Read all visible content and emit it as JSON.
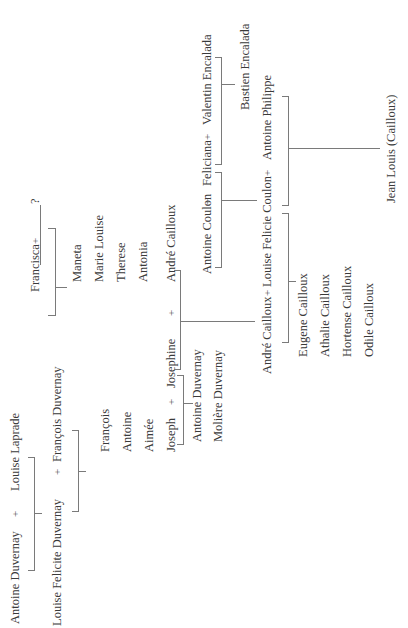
{
  "diagram": {
    "type": "family-tree",
    "orientation": "rotated-90-ccw",
    "line_color": "#7a7a7a",
    "text_color": "#3a3a3a",
    "couples": [
      {
        "id": "c1",
        "partner_a": "Antoine Duvernay",
        "connector": "+",
        "partner_b": "Louise Laprade",
        "children": [
          "Louise Felicite Duvernay"
        ]
      },
      {
        "id": "c2",
        "partner_a": "Louise Felicite Duvernay",
        "connector": "+",
        "partner_b": "François Duvernay",
        "children": [
          "François",
          "Antoine",
          "Aimée",
          "Joseph"
        ]
      },
      {
        "id": "c3",
        "partner_a": "Francisca",
        "connector": "+",
        "partner_b": "?",
        "children": [
          "Maneta",
          "Marie Louise",
          "Therese",
          "Antonia",
          "André Cailloux"
        ]
      },
      {
        "id": "c4",
        "partner_a": "Joseph",
        "connector": "+",
        "partner_b": "Josephine",
        "children": [
          "Antoine Duvernay",
          "Molière Duvernay"
        ]
      },
      {
        "id": "c5",
        "partner_a": "Josephine",
        "connector": "+",
        "partner_b": "André Cailloux",
        "children": [
          "André Cailloux"
        ]
      },
      {
        "id": "c6",
        "partner_a": "Antoine Coulon",
        "connector": "+",
        "partner_b": "Feliciana",
        "children": [
          "Louise Felicie Coulon"
        ]
      },
      {
        "id": "c7",
        "partner_a": "Feliciana",
        "connector": "+",
        "partner_b": "Valentin Encalada",
        "children": [
          "Bastien Encalada"
        ]
      },
      {
        "id": "c8",
        "partner_a": "André Cailloux",
        "connector": "+",
        "partner_b": "Louise Felicie Coulon",
        "children": [
          "Eugene Cailloux",
          "Athalie Cailloux",
          "Hortense Cailloux",
          "Odile Cailloux"
        ]
      },
      {
        "id": "c9",
        "partner_a": "Louise Felicie Coulon",
        "connector": "+",
        "partner_b": "Antoine Philippe",
        "children": [
          "Jean Louis (Cailloux)"
        ]
      }
    ],
    "labels": {
      "antoine_duvernay_sr": "Antoine Duvernay",
      "louise_laprade": "Louise Laprade",
      "louise_felicite_duvernay": "Louise Felicite Duvernay",
      "francois_duvernay": "François Duvernay",
      "francisca": "Francisca",
      "unknown_partner": "?",
      "maneta": "Maneta",
      "marie_louise": "Marie Louise",
      "therese": "Therese",
      "antonia": "Antonia",
      "andre_cailloux_sr": "André Cailloux",
      "francois": "François",
      "antoine": "Antoine",
      "aimee": "Aimée",
      "joseph": "Joseph",
      "josephine": "Josephine",
      "antoine_duvernay_jr": "Antoine Duvernay",
      "moliere_duvernay": "Molière Duvernay",
      "antoine_coulon": "Antoine Coulon",
      "feliciana": "Feliciana",
      "valentin_encalada": "Valentin Encalada",
      "bastien_encalada": "Bastien Encalada",
      "andre_cailloux_jr": "André Cailloux",
      "louise_felicie_coulon": "Louise Felicie Coulon",
      "antoine_philippe": "Antoine Philippe",
      "eugene_cailloux": "Eugene Cailloux",
      "athalie_cailloux": "Athalie Cailloux",
      "hortense_cailloux": "Hortense Cailloux",
      "odile_cailloux": "Odile Cailloux",
      "jean_louis_cailloux": "Jean Louis (Cailloux)",
      "plus": "+"
    }
  }
}
